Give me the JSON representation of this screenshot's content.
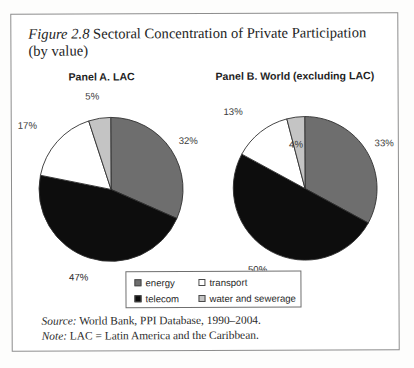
{
  "figure": {
    "number_label": "Figure 2.8",
    "title_rest": " Sectoral Concentration of Private Participation",
    "title_line2": "(by value)",
    "source_lead": "Source:",
    "source_text": " World Bank, PPI Database, 1990–2004.",
    "note_lead": "Note:",
    "note_text": " LAC = Latin America and the Caribbean."
  },
  "legend": {
    "entries": [
      {
        "label": "energy",
        "color": "#6e6e6e"
      },
      {
        "label": "transport",
        "color": "#ffffff"
      },
      {
        "label": "telecom",
        "color": "#0d0d0d"
      },
      {
        "label": "water and sewerage",
        "color": "#c4c4c4"
      }
    ]
  },
  "chart_data": [
    {
      "type": "pie",
      "title": "Panel A. LAC",
      "categories": [
        "energy",
        "telecom",
        "transport",
        "water and sewerage"
      ],
      "values": [
        32,
        47,
        17,
        5
      ],
      "labels": [
        "32%",
        "47%",
        "17%",
        "5%"
      ],
      "colors": [
        "#6e6e6e",
        "#0d0d0d",
        "#ffffff",
        "#c4c4c4"
      ],
      "units": "percent",
      "start_angle_deg": 0,
      "direction": "clockwise",
      "legend_position": "bottom-center"
    },
    {
      "type": "pie",
      "title": "Panel B. World (excluding LAC)",
      "categories": [
        "energy",
        "telecom",
        "transport",
        "water and sewerage"
      ],
      "values": [
        33,
        50,
        13,
        4
      ],
      "labels": [
        "33%",
        "50%",
        "13%",
        "4%"
      ],
      "colors": [
        "#6e6e6e",
        "#0d0d0d",
        "#ffffff",
        "#c4c4c4"
      ],
      "units": "percent",
      "start_angle_deg": 0,
      "direction": "clockwise",
      "legend_position": "bottom-center"
    }
  ]
}
